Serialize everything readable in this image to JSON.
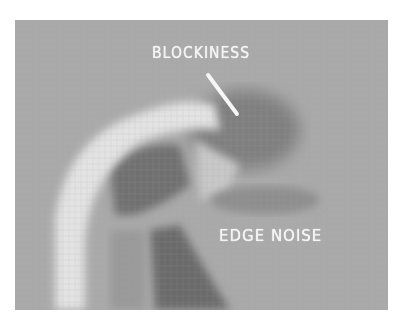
{
  "figure": {
    "background_color": "#a9a9a9",
    "annotations": [
      {
        "label": "BLOCKINESS",
        "pointer": "white diagonal line pointing to block artifacts"
      },
      {
        "label": "EDGE NOISE",
        "pointer": "none"
      }
    ]
  }
}
